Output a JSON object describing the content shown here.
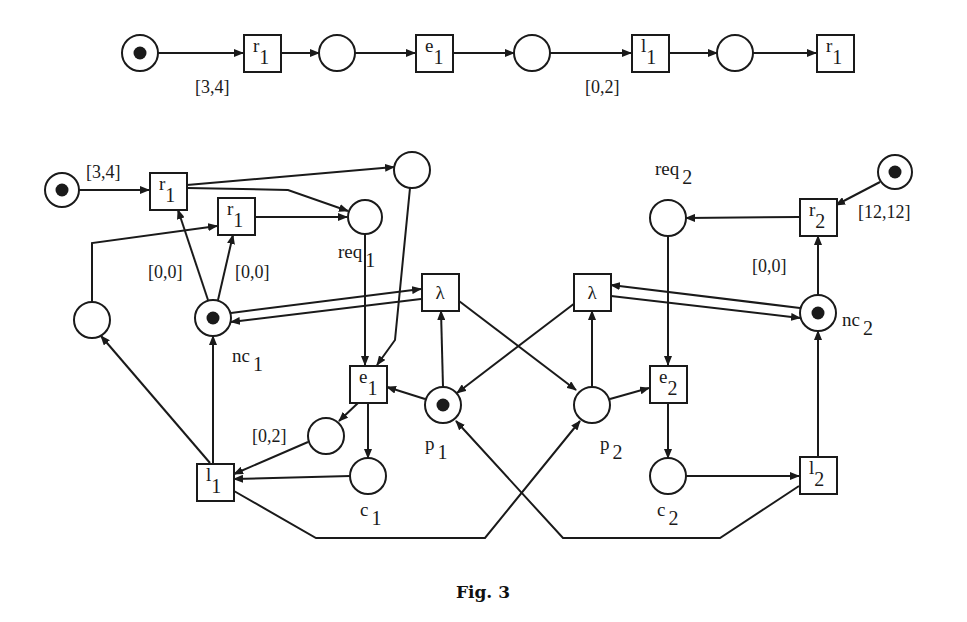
{
  "figure": {
    "caption": "Fig. 3",
    "stroke_color": "#1a1a1a",
    "background": "#ffffff"
  },
  "top_chain": {
    "places": [
      {
        "id": "t_p0",
        "x": 140,
        "y": 53,
        "r": 18,
        "token": true
      },
      {
        "id": "t_p1",
        "x": 337,
        "y": 53,
        "r": 18,
        "token": false
      },
      {
        "id": "t_p2",
        "x": 532,
        "y": 53,
        "r": 18,
        "token": false
      },
      {
        "id": "t_p3",
        "x": 735,
        "y": 53,
        "r": 18,
        "token": false
      }
    ],
    "transitions": [
      {
        "id": "t_r1",
        "x": 262,
        "y": 53,
        "name": "r",
        "sub": "1"
      },
      {
        "id": "t_e1",
        "x": 434,
        "y": 53,
        "name": "e",
        "sub": "1"
      },
      {
        "id": "t_l1",
        "x": 650,
        "y": 53,
        "name": "l",
        "sub": "1"
      },
      {
        "id": "t_r1b",
        "x": 835,
        "y": 53,
        "name": "r",
        "sub": "1"
      }
    ],
    "arcs": [
      {
        "from": [
          158,
          53
        ],
        "to": [
          243,
          53
        ]
      },
      {
        "from": [
          281,
          53
        ],
        "to": [
          319,
          53
        ]
      },
      {
        "from": [
          355,
          53
        ],
        "to": [
          415,
          53
        ]
      },
      {
        "from": [
          453,
          53
        ],
        "to": [
          514,
          53
        ]
      },
      {
        "from": [
          550,
          53
        ],
        "to": [
          631,
          53
        ]
      },
      {
        "from": [
          669,
          53
        ],
        "to": [
          717,
          53
        ]
      },
      {
        "from": [
          753,
          53
        ],
        "to": [
          816,
          53
        ]
      }
    ],
    "interval_labels": [
      {
        "text": "[3,4]",
        "x": 195,
        "y": 93
      },
      {
        "text": "[0,2]",
        "x": 585,
        "y": 93
      }
    ]
  },
  "net": {
    "places": [
      {
        "id": "start1",
        "x": 62,
        "y": 190,
        "r": 17,
        "token": true,
        "label": "",
        "sub": ""
      },
      {
        "id": "aux_top",
        "x": 412,
        "y": 170,
        "r": 18,
        "token": false,
        "label": "",
        "sub": ""
      },
      {
        "id": "req1",
        "x": 365,
        "y": 217,
        "r": 17,
        "token": false,
        "label": "req",
        "sub": "1",
        "lx": 338,
        "ly": 258
      },
      {
        "id": "aux_left",
        "x": 92,
        "y": 320,
        "r": 18,
        "token": false,
        "label": "",
        "sub": ""
      },
      {
        "id": "nc1",
        "x": 213,
        "y": 318,
        "r": 18,
        "token": true,
        "label": "nc",
        "sub": "1",
        "lx": 232,
        "ly": 362
      },
      {
        "id": "p1",
        "x": 443,
        "y": 405,
        "r": 18,
        "token": true,
        "label": "p",
        "sub": "1",
        "lx": 425,
        "ly": 450
      },
      {
        "id": "p2",
        "x": 592,
        "y": 405,
        "r": 18,
        "token": false,
        "label": "p",
        "sub": "2",
        "lx": 600,
        "ly": 450
      },
      {
        "id": "aux_small",
        "x": 326,
        "y": 436,
        "r": 18,
        "token": false,
        "label": "",
        "sub": ""
      },
      {
        "id": "c1",
        "x": 368,
        "y": 476,
        "r": 18,
        "token": false,
        "label": "c",
        "sub": "1",
        "lx": 360,
        "ly": 516
      },
      {
        "id": "c2",
        "x": 668,
        "y": 476,
        "r": 18,
        "token": false,
        "label": "c",
        "sub": "2",
        "lx": 657,
        "ly": 516
      },
      {
        "id": "req2",
        "x": 668,
        "y": 218,
        "r": 18,
        "token": false,
        "label": "req",
        "sub": "2",
        "lx": 655,
        "ly": 175
      },
      {
        "id": "start2",
        "x": 895,
        "y": 172,
        "r": 17,
        "token": true,
        "label": "",
        "sub": ""
      },
      {
        "id": "nc2",
        "x": 818,
        "y": 313,
        "r": 18,
        "token": true,
        "label": "nc",
        "sub": "2",
        "lx": 842,
        "ly": 326
      }
    ],
    "transitions": [
      {
        "id": "r1a",
        "x": 168,
        "y": 191,
        "name": "r",
        "sub": "1"
      },
      {
        "id": "r1b",
        "x": 236,
        "y": 216,
        "name": "r",
        "sub": "1"
      },
      {
        "id": "lambda1",
        "x": 440,
        "y": 292,
        "name": "λ",
        "sub": ""
      },
      {
        "id": "lambda2",
        "x": 592,
        "y": 292,
        "name": "λ",
        "sub": ""
      },
      {
        "id": "e1",
        "x": 368,
        "y": 384,
        "name": "e",
        "sub": "1"
      },
      {
        "id": "e2",
        "x": 668,
        "y": 384,
        "name": "e",
        "sub": "2"
      },
      {
        "id": "l1",
        "x": 215,
        "y": 482,
        "name": "l",
        "sub": "1"
      },
      {
        "id": "l2",
        "x": 818,
        "y": 475,
        "name": "l",
        "sub": "2"
      },
      {
        "id": "r2",
        "x": 818,
        "y": 217,
        "name": "r",
        "sub": "2"
      }
    ],
    "arcs": [
      {
        "pts": [
          [
            79,
            190
          ],
          [
            149,
            190
          ]
        ],
        "arrow": true
      },
      {
        "pts": [
          [
            187,
            185
          ],
          [
            394,
            167
          ]
        ],
        "arrow": true
      },
      {
        "pts": [
          [
            187,
            188
          ],
          [
            288,
            190
          ],
          [
            348,
            211
          ]
        ],
        "arrow": true
      },
      {
        "pts": [
          [
            255,
            217
          ],
          [
            347,
            217
          ]
        ],
        "arrow": true
      },
      {
        "pts": [
          [
            92,
            302
          ],
          [
            92,
            243
          ],
          [
            217,
            226
          ]
        ],
        "arrow": true
      },
      {
        "pts": [
          [
            208,
            300
          ],
          [
            178,
            210
          ]
        ],
        "arrow": true
      },
      {
        "pts": [
          [
            218,
            300
          ],
          [
            233,
            235
          ]
        ],
        "arrow": true
      },
      {
        "pts": [
          [
            231,
            313
          ],
          [
            421,
            289
          ]
        ],
        "arrow": true
      },
      {
        "pts": [
          [
            421,
            299
          ],
          [
            231,
            322
          ]
        ],
        "arrow": true
      },
      {
        "pts": [
          [
            365,
            234
          ],
          [
            365,
            365
          ]
        ],
        "arrow": true
      },
      {
        "pts": [
          [
            410,
            188
          ],
          [
            395,
            340
          ],
          [
            377,
            365
          ]
        ],
        "arrow": true
      },
      {
        "pts": [
          [
            425,
            399
          ],
          [
            387,
            387
          ]
        ],
        "arrow": true
      },
      {
        "pts": [
          [
            443,
            387
          ],
          [
            441,
            311
          ]
        ],
        "arrow": true
      },
      {
        "pts": [
          [
            459,
            301
          ],
          [
            576,
            390
          ]
        ],
        "arrow": true
      },
      {
        "pts": [
          [
            575,
            303
          ],
          [
            457,
            393
          ]
        ],
        "arrow": true
      },
      {
        "pts": [
          [
            592,
            387
          ],
          [
            592,
            311
          ]
        ],
        "arrow": true
      },
      {
        "pts": [
          [
            610,
            399
          ],
          [
            649,
            388
          ]
        ],
        "arrow": true
      },
      {
        "pts": [
          [
            358,
            403
          ],
          [
            339,
            421
          ]
        ],
        "arrow": true
      },
      {
        "pts": [
          [
            368,
            403
          ],
          [
            368,
            458
          ]
        ],
        "arrow": true
      },
      {
        "pts": [
          [
            308,
            442
          ],
          [
            234,
            474
          ]
        ],
        "arrow": true
      },
      {
        "pts": [
          [
            350,
            476
          ],
          [
            234,
            479
          ]
        ],
        "arrow": true
      },
      {
        "pts": [
          [
            210,
            463
          ],
          [
            101,
            336
          ]
        ],
        "arrow": true
      },
      {
        "pts": [
          [
            213,
            463
          ],
          [
            213,
            336
          ]
        ],
        "arrow": true
      },
      {
        "pts": [
          [
            234,
            491
          ],
          [
            316,
            538
          ],
          [
            485,
            538
          ],
          [
            580,
            421
          ]
        ],
        "arrow": true
      },
      {
        "pts": [
          [
            799,
            486
          ],
          [
            720,
            538
          ],
          [
            563,
            538
          ],
          [
            456,
            421
          ]
        ],
        "arrow": true
      },
      {
        "pts": [
          [
            668,
            236
          ],
          [
            668,
            365
          ]
        ],
        "arrow": true
      },
      {
        "pts": [
          [
            668,
            403
          ],
          [
            668,
            458
          ]
        ],
        "arrow": true
      },
      {
        "pts": [
          [
            686,
            476
          ],
          [
            799,
            476
          ]
        ],
        "arrow": true
      },
      {
        "pts": [
          [
            818,
            456
          ],
          [
            818,
            331
          ]
        ],
        "arrow": true
      },
      {
        "pts": [
          [
            818,
            295
          ],
          [
            818,
            236
          ]
        ],
        "arrow": true
      },
      {
        "pts": [
          [
            799,
            217
          ],
          [
            686,
            218
          ]
        ],
        "arrow": true
      },
      {
        "pts": [
          [
            880,
            182
          ],
          [
            836,
            205
          ]
        ],
        "arrow": true
      },
      {
        "pts": [
          [
            800,
            308
          ],
          [
            611,
            285
          ]
        ],
        "arrow": true
      },
      {
        "pts": [
          [
            611,
            296
          ],
          [
            800,
            318
          ]
        ],
        "arrow": true
      }
    ],
    "interval_labels": [
      {
        "text": "[3,4]",
        "x": 86,
        "y": 178
      },
      {
        "text": "[0,0]",
        "x": 148,
        "y": 278
      },
      {
        "text": "[0,0]",
        "x": 235,
        "y": 278
      },
      {
        "text": "[0,2]",
        "x": 252,
        "y": 442
      },
      {
        "text": "[0,0]",
        "x": 752,
        "y": 272
      },
      {
        "text": "[12,12]",
        "x": 858,
        "y": 218
      }
    ]
  }
}
